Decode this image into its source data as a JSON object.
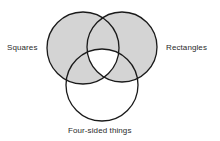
{
  "diagram": {
    "type": "venn",
    "sets": [
      {
        "id": "squares",
        "label": "Squares",
        "cx": 83,
        "cy": 48,
        "r": 36
      },
      {
        "id": "rectangles",
        "label": "Rectangles",
        "cx": 122,
        "cy": 47,
        "r": 35
      },
      {
        "id": "four_sided",
        "label": "Four-sided things",
        "cx": 102,
        "cy": 85,
        "r": 36
      }
    ],
    "shaded_region": "Squares ∪ Rectangles, excluding Squares ∩ Rectangles ∩ Four-sided things",
    "colors": {
      "background": "#ffffff",
      "shade": "#d4d4d4",
      "stroke": "#1a1a1a",
      "text": "#2a2a2a"
    }
  }
}
